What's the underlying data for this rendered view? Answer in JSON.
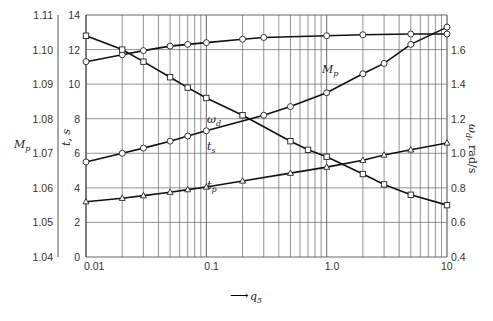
{
  "chart_data": {
    "type": "line",
    "title": "",
    "xlabel": "q5",
    "xscale": "log",
    "xlim": [
      0.01,
      10
    ],
    "x_tick_labels": [
      "0.01",
      "0.1",
      "1.0",
      "10"
    ],
    "axes": {
      "Mp": {
        "label": "Mp",
        "ticks": [
          "1.04",
          "1.05",
          "1.06",
          "1.07",
          "1.08",
          "1.09",
          "1.10",
          "1.11"
        ],
        "range": [
          1.04,
          1.11
        ]
      },
      "t": {
        "label": "t, s",
        "ticks": [
          "0",
          "2",
          "4",
          "6",
          "8",
          "10",
          "12",
          "14"
        ],
        "range": [
          0,
          14
        ]
      },
      "omega": {
        "label": "ωd, rad/s",
        "ticks": [
          "0.4",
          "0.6",
          "0.8",
          "1.0",
          "1.2",
          "1.4",
          "1.6"
        ],
        "range": [
          0.4,
          1.8
        ]
      }
    },
    "grid": true,
    "x": [
      0.01,
      0.02,
      0.03,
      0.05,
      0.07,
      0.1,
      0.2,
      0.3,
      0.5,
      0.7,
      1.0,
      2.0,
      3.0,
      5.0,
      10.0
    ],
    "series": [
      {
        "name": "Mp",
        "axis": "Mp",
        "marker": "circle",
        "x": [
          0.01,
          0.02,
          0.03,
          0.05,
          0.07,
          0.1,
          0.2,
          0.3,
          1.0,
          2.0,
          5.0,
          10.0
        ],
        "values": [
          1.0965,
          1.0985,
          1.0997,
          1.101,
          1.1015,
          1.102,
          1.103,
          1.1035,
          1.104,
          1.1043,
          1.1045,
          1.1045
        ]
      },
      {
        "name": "ωd",
        "axis": "omega",
        "marker": "square",
        "x": [
          0.01,
          0.02,
          0.03,
          0.05,
          0.07,
          0.1,
          0.2,
          0.5,
          0.7,
          1.0,
          2.0,
          3.0,
          5.0,
          10.0
        ],
        "values": [
          1.68,
          1.6,
          1.53,
          1.44,
          1.38,
          1.32,
          1.22,
          1.07,
          1.02,
          0.98,
          0.88,
          0.82,
          0.76,
          0.7
        ]
      },
      {
        "name": "ts",
        "axis": "t",
        "marker": "circle",
        "x": [
          0.01,
          0.02,
          0.03,
          0.05,
          0.07,
          0.1,
          0.3,
          0.5,
          1.0,
          2.0,
          3.0,
          5.0,
          10.0
        ],
        "values": [
          5.5,
          6.0,
          6.3,
          6.7,
          7.0,
          7.3,
          8.2,
          8.7,
          9.5,
          10.6,
          11.2,
          12.3,
          13.3
        ]
      },
      {
        "name": "tp",
        "axis": "t",
        "marker": "triangle",
        "x": [
          0.01,
          0.02,
          0.03,
          0.05,
          0.07,
          0.1,
          0.2,
          0.5,
          1.0,
          2.0,
          3.0,
          5.0,
          10.0
        ],
        "values": [
          3.2,
          3.4,
          3.55,
          3.75,
          3.9,
          4.05,
          4.4,
          4.85,
          5.2,
          5.6,
          5.9,
          6.2,
          6.6
        ]
      }
    ],
    "annotations": [
      "Mp",
      "ωd",
      "ts",
      "tp"
    ]
  },
  "labels": {
    "mp_axis": "M",
    "mp_axis_sub": "p",
    "t_axis": "t, s",
    "omega_axis": "ω",
    "omega_axis_sub": "d",
    "omega_axis_unit": ", rad/s",
    "x_axis_arrow": "⟶",
    "x_axis": "q",
    "x_axis_sub": "5",
    "curve_mp": "M",
    "curve_mp_sub": "p",
    "curve_wd": "ω",
    "curve_wd_sub": "d",
    "curve_ts": "t",
    "curve_ts_sub": "s",
    "curve_tp": "t",
    "curve_tp_sub": "p"
  }
}
